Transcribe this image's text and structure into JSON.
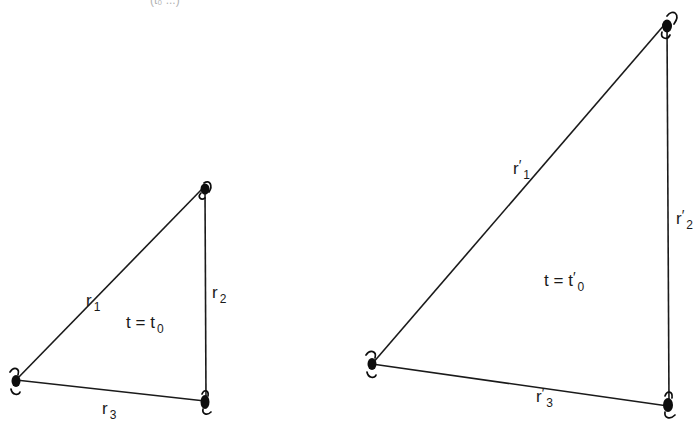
{
  "figure": {
    "top_fragment": "(t₀ ...)",
    "panels": [
      {
        "id": "left",
        "time_label": {
          "var": "t",
          "eq": "=",
          "t": "t",
          "sub": "0",
          "prime": ""
        },
        "vertices": [
          {
            "name": "top",
            "x": 205,
            "y": 190
          },
          {
            "name": "bottom-left",
            "x": 16,
            "y": 380
          },
          {
            "name": "bottom-right",
            "x": 205,
            "y": 400
          }
        ],
        "edges": [
          {
            "label": "r",
            "sub": "1",
            "prime": ""
          },
          {
            "label": "r",
            "sub": "2",
            "prime": ""
          },
          {
            "label": "r",
            "sub": "3",
            "prime": ""
          }
        ]
      },
      {
        "id": "right",
        "time_label": {
          "var": "t",
          "eq": "=",
          "t": "t",
          "sub": "0",
          "prime": "′"
        },
        "vertices": [
          {
            "name": "top",
            "x": 667,
            "y": 22
          },
          {
            "name": "bottom-left",
            "x": 372,
            "y": 364
          },
          {
            "name": "bottom-right",
            "x": 668,
            "y": 405
          }
        ],
        "edges": [
          {
            "label": "r",
            "sub": "1",
            "prime": "′"
          },
          {
            "label": "r",
            "sub": "2",
            "prime": "′"
          },
          {
            "label": "r",
            "sub": "3",
            "prime": "′"
          }
        ]
      }
    ],
    "colors": {
      "line": "#1a1a1a",
      "mass": "#0d0d0d",
      "background": "#ffffff"
    }
  }
}
